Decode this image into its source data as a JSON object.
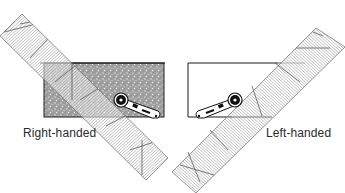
{
  "diagram": {
    "panels": [
      {
        "id": "right",
        "label": "Right-handed",
        "fabric": "textured",
        "cutter_side": "right"
      },
      {
        "id": "left",
        "label": "Left-handed",
        "fabric": "plain",
        "cutter_side": "left"
      }
    ],
    "colors": {
      "ruler_line": "#8a8a8a",
      "ruler_edge": "#6a6a6a",
      "fabric_dark": "#9a9a9a",
      "fabric_outline": "#1a1a1a",
      "cutter": "#111111",
      "text": "#2a2a2a"
    }
  }
}
